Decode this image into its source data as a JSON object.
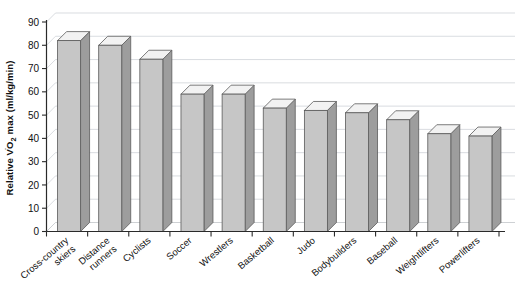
{
  "chart_data": {
    "type": "bar",
    "title": "",
    "subtitle": "",
    "xlabel": "",
    "ylabel": "Relative VO2 max (ml/kg/min)",
    "ylabel_display": "Relative V̇O₂ max (ml/kg/min)",
    "ylim": [
      0,
      90
    ],
    "ytick_step": 10,
    "ytick_labels": [
      "90",
      "80",
      "70",
      "60",
      "50",
      "40",
      "30",
      "20",
      "10",
      "0"
    ],
    "ytick_values": [
      90,
      80,
      70,
      60,
      50,
      40,
      30,
      20,
      10,
      0
    ],
    "grid": true,
    "legend": "none",
    "style": "3d-column",
    "categories": [
      "Cross-country skiers",
      "Distance runners",
      "Cyclists",
      "Soccer",
      "Wrestlers",
      "Basketball",
      "Judo",
      "Bodybuilders",
      "Baseball",
      "Weightlifters",
      "Powerlifters"
    ],
    "category_lines": [
      [
        "Cross-country",
        "skiers"
      ],
      [
        "Distance",
        "runners"
      ],
      [
        "Cyclists"
      ],
      [
        "Soccer"
      ],
      [
        "Wrestlers"
      ],
      [
        "Basketball"
      ],
      [
        "Judo"
      ],
      [
        "Bodybuilders"
      ],
      [
        "Baseball"
      ],
      [
        "Weightlifters"
      ],
      [
        "Powerlifters"
      ]
    ],
    "values": [
      82,
      80,
      74,
      59,
      59,
      53,
      52,
      51,
      48,
      42,
      41
    ],
    "colors": {
      "bar_front": "#c6c6c6",
      "bar_side": "#9d9d9d",
      "bar_top": "#f2f2f2",
      "bar_outline": "#5a5a5a",
      "gridline": "#c9cdd2",
      "axis": "#2a2a2a",
      "background": "#ffffff",
      "text": "#111111"
    }
  }
}
